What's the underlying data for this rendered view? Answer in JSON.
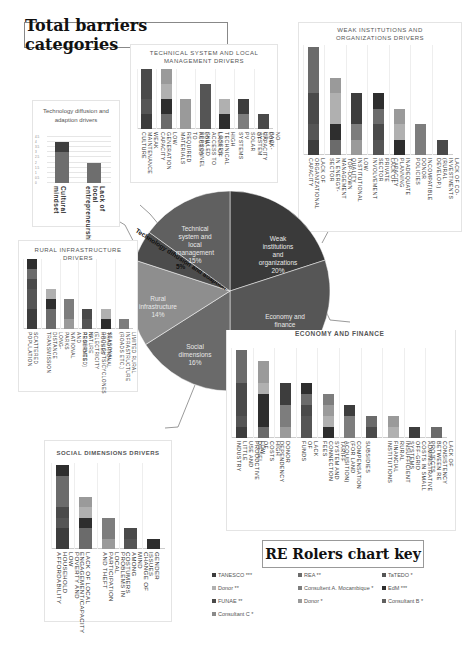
{
  "title": "Total barriers categories",
  "colors": {
    "c1": "#3d3d3d",
    "c2": "#6b6b6b",
    "c3": "#9a9a9a",
    "c4": "#555555",
    "c5": "#2e2e2e",
    "c6": "#7d7d7d",
    "c7": "#4a4a4a",
    "c8": "#b0b0b0"
  },
  "pie": {
    "slices": [
      {
        "label": "Weak institutions and organizations",
        "pct_label": "20%",
        "value": 20,
        "color": "#3a3a3a"
      },
      {
        "label": "Economy and finance",
        "pct_label": "90%",
        "value": 30,
        "color": "#565656"
      },
      {
        "label": "Social dimensions",
        "pct_label": "16%",
        "value": 16,
        "color": "#6a6a6a"
      },
      {
        "label": "Rural infrastructure",
        "pct_label": "14%",
        "value": 14,
        "color": "#8e8e8e"
      },
      {
        "label": "Technology diffusion and adaption",
        "pct_label": "5%",
        "value": 5,
        "color": "#4c4c4c"
      },
      {
        "label": "Technical system and local management",
        "pct_label": "15%",
        "value": 15,
        "color": "#606060"
      }
    ]
  },
  "panels": {
    "tech_diffusion": {
      "title": "Technology diffusion and adaption drivers",
      "y_ticks": [
        "0",
        "0.5",
        "1",
        "1.5",
        "2",
        "2.5",
        "3",
        "3.5",
        "4",
        "4.5"
      ],
      "bars": [
        {
          "label": "Cultural mindset",
          "segments": [
            3,
            1
          ]
        },
        {
          "label": "Lack of local entrepreneurship",
          "segments": [
            2
          ]
        }
      ]
    },
    "technical": {
      "title": "TECHNICAL SYSTEM AND LOCAL MANAGEMENT DRIVERS",
      "bars": [
        {
          "label": "WEAK MAINTENANCE CULTURE",
          "segments": [
            1,
            1,
            2
          ]
        },
        {
          "label": "LOW GENERATION CAPACITY",
          "segments": [
            1,
            1,
            1,
            1
          ]
        },
        {
          "label": "LOW ACCESS TO REQUIRED MATERIALS",
          "segments": [
            2
          ]
        },
        {
          "label": "LACK OF ACCESS TO SKILLED PERSONNEL",
          "segments": [
            3
          ]
        },
        {
          "label": "HIGH TECHNICAL LOSSES",
          "segments": [
            1,
            1
          ]
        },
        {
          "label": "LOW CAPACITY OF SOLAR PV SYSTEMS",
          "segments": [
            1,
            1
          ]
        },
        {
          "label": "NO BACK-UP SYSTEM",
          "segments": [
            1
          ]
        }
      ]
    },
    "institutions": {
      "title": "WEAK INSTITUTIONS AND ORGANIZATIONS DRIVERS",
      "bars": [
        {
          "label": "LACK OF ORGANIZATIONAL CAPACITY",
          "segments": [
            1,
            1,
            2,
            3
          ]
        },
        {
          "label": "TOP-DOWN MANAGEMENT IN ENERGY-SECTOR",
          "segments": [
            1,
            1,
            2,
            1
          ]
        },
        {
          "label": "LOW INSTITUTIONAL QUALITY",
          "segments": [
            1,
            1,
            2
          ]
        },
        {
          "label": "LACK OF PRIVATE SECTOR INVOLVEMENT",
          "segments": [
            1,
            1,
            1,
            1
          ]
        },
        {
          "label": "INADEQUATE PLANNING CAPACITY",
          "segments": [
            1,
            1,
            1
          ]
        },
        {
          "label": "INCOMPATIBLE DONOR POLICIES",
          "segments": [
            2
          ]
        },
        {
          "label": "LACK OF CO-INVESTMENTS (RURAL DEVELOP.)",
          "segments": [
            1
          ]
        }
      ]
    },
    "rural": {
      "title": "RURAL INFRASTRUCTURE DRIVERS",
      "bars": [
        {
          "label": "SCATTERED POPULATION",
          "segments": [
            2,
            2,
            1,
            1,
            1
          ]
        },
        {
          "label": "LONG-DISTANCE TRANSMISSION",
          "segments": [
            2,
            1,
            1
          ]
        },
        {
          "label": "NATURE RESERVES AND NATIONAL PARKS",
          "segments": [
            1,
            2
          ]
        },
        {
          "label": "TRADITIONAL HOUSES (ELECTRICITY IS PROHIBITED)",
          "segments": [
            1,
            1
          ]
        },
        {
          "label": "SEASONAL DROUGHTS/CYCLONES",
          "segments": [
            1,
            1
          ]
        },
        {
          "label": "LIMITED RURAL INFRASTRUCTURE (ROADS ETC.)",
          "segments": [
            1
          ]
        }
      ]
    },
    "economy": {
      "title": "ECONOMY AND FINANCE",
      "bars": [
        {
          "label": "LOW PRODUCTIVE USE AND LITTLE INDUSTRY",
          "segments": [
            1,
            1,
            3,
            3
          ]
        },
        {
          "label": "HIGH COSTS OF DIESEL",
          "segments": [
            1,
            3,
            1,
            2
          ]
        },
        {
          "label": "DONOR DEPENDENCY",
          "segments": [
            1,
            2,
            2
          ]
        },
        {
          "label": "LACK OF FUNDS",
          "segments": [
            2,
            1,
            1,
            1
          ]
        },
        {
          "label": "TARIFF SYSTEM AND CONNECTION FEES",
          "segments": [
            1,
            1,
            1,
            1
          ]
        },
        {
          "label": "COMPENSATION (FOR LAND ACQUISITION)",
          "segments": [
            2,
            1
          ]
        },
        {
          "label": "SUBSIDIES",
          "segments": [
            1,
            1
          ]
        },
        {
          "label": "INSUFFICIENT RURAL FINANCIAL INSTITUTIONS",
          "segments": [
            1,
            1
          ]
        },
        {
          "label": "ADMINISTRATIVE COSTS IN SMALL OFF-GRID SYSTEMS",
          "segments": [
            1
          ]
        },
        {
          "label": "LACK OF CONSISTENCY BETWEEN RE PROJECTS",
          "segments": [
            1
          ]
        }
      ]
    },
    "social": {
      "title": "SOCIAL DIMENSIONS DRIVERS",
      "bars": [
        {
          "label": "POVERTY AND LOW HOUSEHOLD AFFORDABILITY",
          "segments": [
            2,
            1,
            1,
            3,
            1
          ]
        },
        {
          "label": "LACK OF LOCAL ENGAGEMENT/CAPACITY",
          "segments": [
            2,
            1,
            1,
            1
          ]
        },
        {
          "label": "PROBLEMS IN LOCAL PARTICIPATION AND THEFT",
          "segments": [
            1,
            2
          ]
        },
        {
          "label": "CHANGE OF MIND AMONG COSTUMERS",
          "segments": [
            1,
            1
          ]
        },
        {
          "label": "GENDER ISSUES",
          "segments": [
            1
          ]
        }
      ]
    }
  },
  "key": {
    "title": "RE Rolers chart key",
    "items": [
      {
        "label": "TANESCO ***",
        "color": "#3d3d3d"
      },
      {
        "label": "REA **",
        "color": "#6b6b6b"
      },
      {
        "label": "TaTEDO *",
        "color": "#555555"
      },
      {
        "label": "Donor **",
        "color": "#b0b0b0"
      },
      {
        "label": "Consultent A. Mocambique *",
        "color": "#7d7d7d"
      },
      {
        "label": "EdM ***",
        "color": "#2e2e2e"
      },
      {
        "label": "FUNAE **",
        "color": "#4a4a4a"
      },
      {
        "label": "Donor *",
        "color": "#9a9a9a"
      },
      {
        "label": "Consultant B *",
        "color": "#606060"
      },
      {
        "label": "Consultant C *",
        "color": "#8a8a8a"
      }
    ]
  },
  "chart_data": [
    {
      "type": "pie",
      "title": "Total barriers categories",
      "categories": [
        "Weak institutions and organizations",
        "Economy and finance",
        "Social dimensions",
        "Rural infrastructure",
        "Technology diffusion and adaption",
        "Technical system and local management"
      ],
      "values": [
        20,
        30,
        16,
        14,
        5,
        15
      ],
      "labels": [
        "20%",
        "90%",
        "16%",
        "14%",
        "5%",
        "15%"
      ]
    },
    {
      "type": "bar",
      "title": "Technology diffusion and adaption drivers",
      "categories": [
        "Cultural mindset",
        "Lack of local entrepreneurship"
      ],
      "values": [
        4,
        2
      ],
      "ylim": [
        0,
        4.5
      ],
      "stacked": true
    },
    {
      "type": "bar",
      "title": "TECHNICAL SYSTEM AND LOCAL MANAGEMENT DRIVERS",
      "categories": [
        "WEAK MAINTENANCE CULTURE",
        "LOW GENERATION CAPACITY",
        "LOW ACCESS TO REQUIRED MATERIALS",
        "LACK OF ACCESS TO SKILLED PERSONNEL",
        "HIGH TECHNICAL LOSSES",
        "LOW CAPACITY OF SOLAR PV SYSTEMS",
        "NO BACK-UP SYSTEM"
      ],
      "values": [
        4,
        4,
        2,
        3,
        2,
        2,
        1
      ],
      "stacked": true
    },
    {
      "type": "bar",
      "title": "WEAK INSTITUTIONS AND ORGANIZATIONS DRIVERS",
      "categories": [
        "LACK OF ORGANIZATIONAL CAPACITY",
        "TOP-DOWN MANAGEMENT IN ENERGY-SECTOR",
        "LOW INSTITUTIONAL QUALITY",
        "LACK OF PRIVATE SECTOR INVOLVEMENT",
        "INADEQUATE PLANNING CAPACITY",
        "INCOMPATIBLE DONOR POLICIES",
        "LACK OF CO-INVESTMENTS (RURAL DEVELOP.)"
      ],
      "values": [
        7,
        5,
        4,
        4,
        3,
        2,
        1
      ],
      "stacked": true
    },
    {
      "type": "bar",
      "title": "RURAL INFRASTRUCTURE DRIVERS",
      "categories": [
        "SCATTERED POPULATION",
        "LONG-DISTANCE TRANSMISSION",
        "NATURE RESERVES AND NATIONAL PARKS",
        "TRADITIONAL HOUSES (ELECTRICITY IS PROHIBITED)",
        "SEASONAL DROUGHTS/CYCLONES",
        "LIMITED RURAL INFRASTRUCTURE (ROADS ETC.)"
      ],
      "values": [
        7,
        4,
        3,
        2,
        2,
        1
      ],
      "stacked": true
    },
    {
      "type": "bar",
      "title": "ECONOMY AND FINANCE",
      "categories": [
        "LOW PRODUCTIVE USE AND LITTLE INDUSTRY",
        "HIGH COSTS OF DIESEL",
        "DONOR DEPENDENCY",
        "LACK OF FUNDS",
        "TARIFF SYSTEM AND CONNECTION FEES",
        "COMPENSATION (FOR LAND ACQUISITION)",
        "SUBSIDIES",
        "INSUFFICIENT RURAL FINANCIAL INSTITUTIONS",
        "ADMINISTRATIVE COSTS IN SMALL OFF-GRID SYSTEMS",
        "LACK OF CONSISTENCY BETWEEN RE PROJECTS"
      ],
      "values": [
        8,
        7,
        5,
        5,
        4,
        3,
        2,
        2,
        1,
        1
      ],
      "stacked": true
    },
    {
      "type": "bar",
      "title": "SOCIAL DIMENSIONS DRIVERS",
      "categories": [
        "POVERTY AND LOW HOUSEHOLD AFFORDABILITY",
        "LACK OF LOCAL ENGAGEMENT/CAPACITY",
        "PROBLEMS IN LOCAL PARTICIPATION AND THEFT",
        "CHANGE OF MIND AMONG COSTUMERS",
        "GENDER ISSUES"
      ],
      "values": [
        8,
        4,
        2.5,
        2,
        1
      ],
      "stacked": true
    }
  ]
}
